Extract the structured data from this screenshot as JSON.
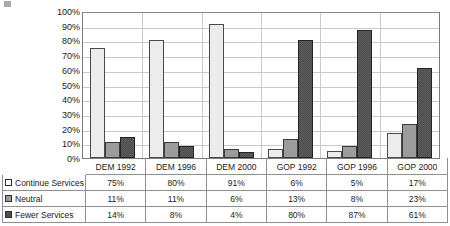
{
  "chart_data": {
    "type": "bar",
    "title": "",
    "xlabel": "",
    "ylabel": "",
    "ylim": [
      0,
      100
    ],
    "ytick_labels": [
      "100%",
      "90%",
      "80%",
      "70%",
      "60%",
      "50%",
      "40%",
      "30%",
      "20%",
      "10%",
      "0%"
    ],
    "ytick_values": [
      100,
      90,
      80,
      70,
      60,
      50,
      40,
      30,
      20,
      10,
      0
    ],
    "grid": true,
    "legend_position": "table-below",
    "categories": [
      "DEM 1992",
      "DEM 1996",
      "DEM 2000",
      "GOP 1992",
      "GOP 1996",
      "GOP 2000"
    ],
    "series": [
      {
        "name": "Continue Services",
        "color": "#ececec",
        "values": [
          75,
          80,
          91,
          6,
          5,
          17
        ],
        "labels": [
          "75%",
          "80%",
          "91%",
          "6%",
          "5%",
          "17%"
        ]
      },
      {
        "name": "Neutral",
        "color": "#9c9c9c",
        "values": [
          11,
          11,
          6,
          13,
          8,
          23
        ],
        "labels": [
          "11%",
          "11%",
          "6%",
          "13%",
          "8%",
          "23%"
        ]
      },
      {
        "name": "Fewer Services",
        "color": "#4e4e4e",
        "values": [
          14,
          8,
          4,
          80,
          87,
          61
        ],
        "labels": [
          "14%",
          "8%",
          "4%",
          "80%",
          "87%",
          "61%"
        ]
      }
    ]
  },
  "data_table": {
    "header": [
      "",
      "DEM 1992",
      "DEM 1996",
      "DEM 2000",
      "GOP 1992",
      "GOP 1996",
      "GOP 2000"
    ],
    "rows": [
      {
        "label": "Continue Services",
        "swatch": "series-0-swatch",
        "cells": [
          "75%",
          "80%",
          "91%",
          "6%",
          "5%",
          "17%"
        ]
      },
      {
        "label": "Neutral",
        "swatch": "series-1-swatch",
        "cells": [
          "11%",
          "11%",
          "6%",
          "13%",
          "8%",
          "23%"
        ]
      },
      {
        "label": "Fewer Services",
        "swatch": "series-2-swatch",
        "cells": [
          "14%",
          "8%",
          "4%",
          "80%",
          "87%",
          "61%"
        ]
      }
    ]
  }
}
